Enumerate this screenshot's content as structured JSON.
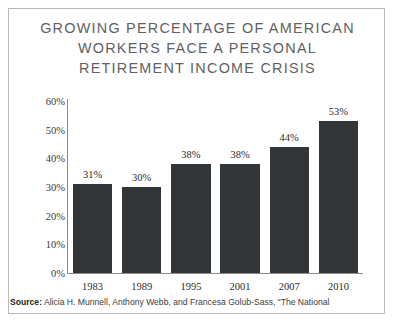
{
  "title": {
    "lines": [
      "GROWING PERCENTAGE OF AMERICAN",
      "WORKERS FACE A PERSONAL",
      "RETIREMENT INCOME CRISIS"
    ]
  },
  "source": {
    "label": "Source:",
    "text": " Alicia H. Munnell, Anthony Webb, and Francesa Golub-Sass, “The National"
  },
  "colors": {
    "bar": "#333638",
    "title": "#5f6163",
    "axis": "#8d8d8d",
    "frame": "#b9b9b9",
    "text": "#2c2c2c"
  },
  "chart_data": {
    "type": "bar",
    "title": "GROWING PERCENTAGE OF AMERICAN WORKERS FACE A PERSONAL RETIREMENT INCOME CRISIS",
    "xlabel": "",
    "ylabel": "",
    "categories": [
      "1983",
      "1989",
      "1995",
      "2001",
      "2007",
      "2010"
    ],
    "values": [
      31,
      30,
      38,
      38,
      44,
      53
    ],
    "value_labels": [
      "31%",
      "30%",
      "38%",
      "38%",
      "44%",
      "53%"
    ],
    "ylim": [
      0,
      60
    ],
    "yticks": [
      0,
      10,
      20,
      30,
      40,
      50,
      60
    ],
    "ytick_labels": [
      "0%",
      "10%",
      "20%",
      "30%",
      "40%",
      "50%",
      "60%"
    ],
    "grid": false,
    "legend": null,
    "series": [
      {
        "name": "Percentage of workers at risk",
        "values": [
          31,
          30,
          38,
          38,
          44,
          53
        ]
      }
    ]
  }
}
